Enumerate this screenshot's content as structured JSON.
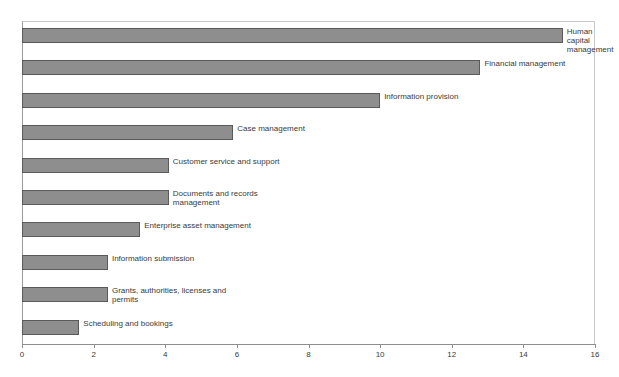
{
  "chart_data": {
    "type": "bar",
    "orientation": "horizontal",
    "title": "",
    "subtitle": "",
    "xlabel": "",
    "ylabel": "",
    "xlim": [
      0,
      16
    ],
    "xticks": [
      0,
      2,
      4,
      6,
      8,
      10,
      12,
      14,
      16
    ],
    "xtick_labels": [
      "0",
      "2",
      "4",
      "6",
      "8",
      "10",
      "12",
      "14",
      "16"
    ],
    "grid": false,
    "legend": null,
    "legend_position": "none",
    "series_color": "#8e8e8e",
    "series_border_color": "#5a5a5a",
    "axis_color": "#8e8e8e",
    "label_color": "#3a3a3a",
    "categories": [
      "Human capital management",
      "Financial management",
      "Information provision",
      "Case management",
      "Customer service and support",
      "Documents and records\nmanagement",
      "Enterprise asset management",
      "Information submission",
      "Grants, authorities, licenses and\npermits",
      "Scheduling and bookings"
    ],
    "values": [
      15.1,
      12.8,
      10.0,
      5.9,
      4.1,
      4.1,
      3.3,
      2.4,
      2.4,
      1.6
    ]
  },
  "top_artifacts": [
    {
      "text": "",
      "left": 18
    },
    {
      "text": "",
      "left": 96
    },
    {
      "text": "",
      "left": 130
    },
    {
      "text": "",
      "left": 420
    }
  ]
}
